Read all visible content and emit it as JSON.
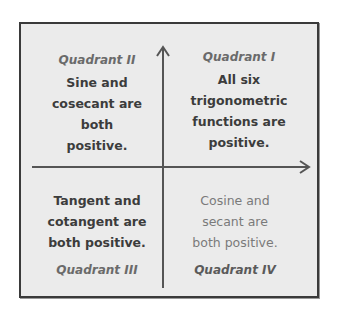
{
  "diagram": {
    "quadrants": [
      {
        "id": "II",
        "title": "Quadrant II",
        "text": "Sine and cosecant are both positive.",
        "lines": [
          "Sine and",
          "cosecant are",
          "both",
          "positive."
        ]
      },
      {
        "id": "I",
        "title": "Quadrant I",
        "text": "All six trigonometric functions are positive.",
        "lines": [
          "All six",
          "trigonometric",
          "functions are",
          "positive."
        ]
      },
      {
        "id": "III",
        "title": "Quadrant III",
        "text": "Tangent and cotangent are both positive.",
        "lines": [
          "Tangent and",
          "cotangent are",
          "both positive."
        ]
      },
      {
        "id": "IV",
        "title": "Quadrant IV",
        "text": "Cosine and secant are both positive.",
        "lines": [
          "Cosine and",
          "secant are",
          "both positive."
        ]
      }
    ],
    "colors": {
      "background": "#ebebeb",
      "frame": "#3a3a3a",
      "axis": "#555555",
      "text_dark": "#3c3c3c",
      "text_light": "#7a7a7a",
      "title": "#6a6a6a"
    },
    "icons": {
      "y_axis_arrow": "arrow-up-icon",
      "x_axis_arrow": "arrow-right-icon"
    }
  }
}
